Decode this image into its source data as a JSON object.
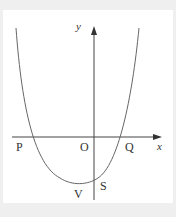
{
  "diagram": {
    "type": "parabola-graph",
    "axes": {
      "x_label": "x",
      "y_label": "y"
    },
    "points": {
      "P": "P",
      "O": "O",
      "Q": "Q",
      "V": "V",
      "S": "S"
    },
    "colors": {
      "background": "#efefef",
      "panel": "#ffffff",
      "stroke": "#555555"
    }
  }
}
